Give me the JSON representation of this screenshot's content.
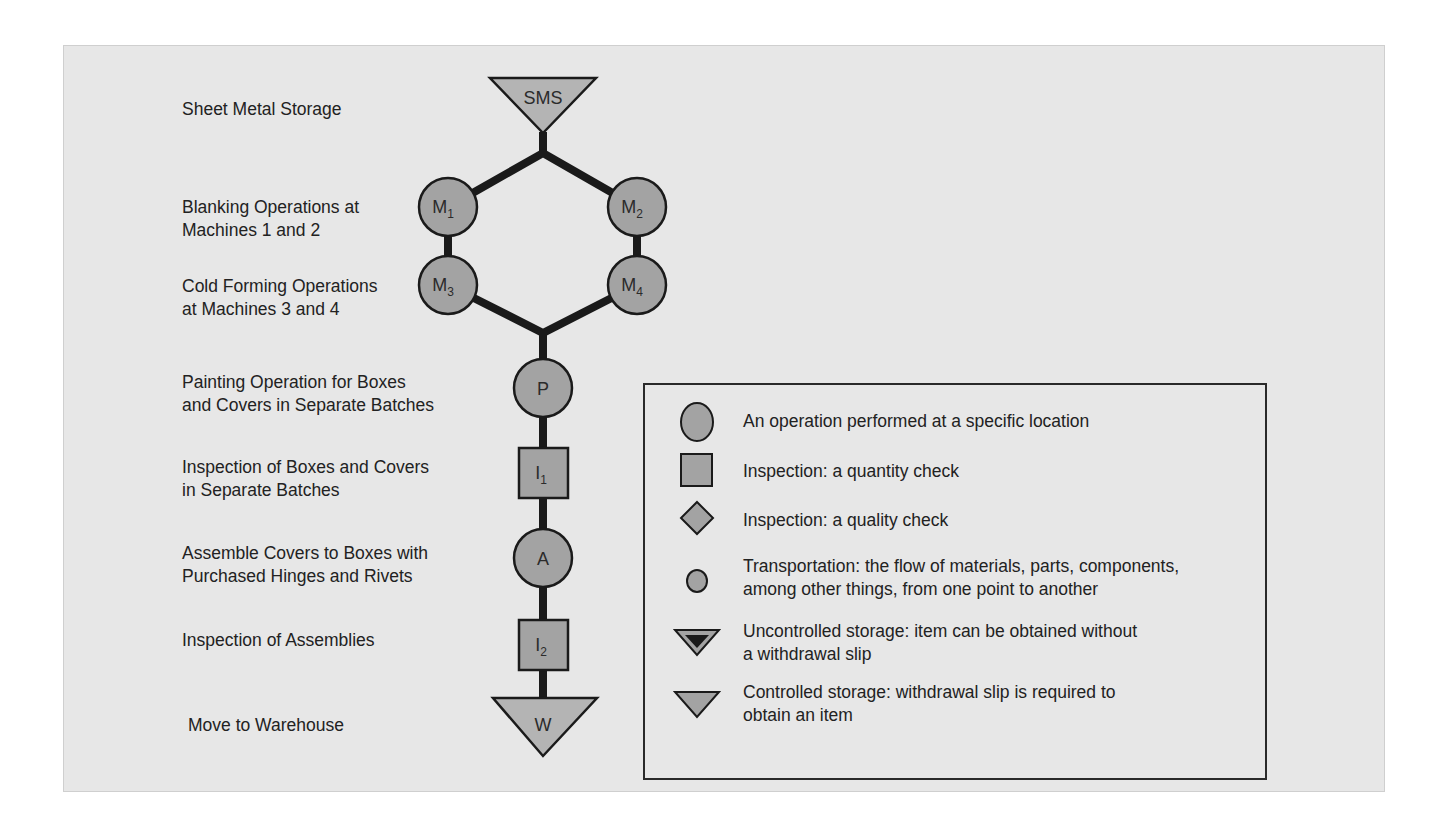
{
  "colors": {
    "background": "#ffffff",
    "panel": "#e7e7e7",
    "shape_fill": "#a3a3a3",
    "storage_fill": "#b4b4b4",
    "line": "#1a1a1a",
    "text": "#222222"
  },
  "steps": [
    {
      "lines": [
        "Sheet Metal Storage"
      ]
    },
    {
      "lines": [
        "Blanking Operations at",
        "Machines 1 and 2"
      ]
    },
    {
      "lines": [
        "Cold Forming Operations",
        "at Machines 3 and 4"
      ]
    },
    {
      "lines": [
        "Painting Operation for Boxes",
        "and Covers in Separate Batches"
      ]
    },
    {
      "lines": [
        "Inspection of Boxes and Covers",
        "in Separate Batches"
      ]
    },
    {
      "lines": [
        "Assemble Covers to Boxes with",
        "Purchased Hinges and Rivets"
      ]
    },
    {
      "lines": [
        "Inspection of Assemblies"
      ]
    },
    {
      "lines": [
        "Move to Warehouse"
      ]
    }
  ],
  "nodes": {
    "sms": {
      "label": "SMS",
      "type": "controlled-storage"
    },
    "m1": {
      "label": "M",
      "sub": "1",
      "type": "operation"
    },
    "m2": {
      "label": "M",
      "sub": "2",
      "type": "operation"
    },
    "m3": {
      "label": "M",
      "sub": "3",
      "type": "operation"
    },
    "m4": {
      "label": "M",
      "sub": "4",
      "type": "operation"
    },
    "p": {
      "label": "P",
      "type": "operation"
    },
    "i1": {
      "label": "I",
      "sub": "1",
      "type": "inspection-quantity"
    },
    "a": {
      "label": "A",
      "type": "operation"
    },
    "i2": {
      "label": "I",
      "sub": "2",
      "type": "inspection-quantity"
    },
    "w": {
      "label": "W",
      "type": "controlled-storage"
    }
  },
  "legend": {
    "items": [
      {
        "icon": "operation-circle-icon",
        "lines": [
          "An operation performed at a specific location"
        ]
      },
      {
        "icon": "inspection-quantity-square-icon",
        "lines": [
          "Inspection: a quantity check"
        ]
      },
      {
        "icon": "inspection-quality-diamond-icon",
        "lines": [
          "Inspection: a quality check"
        ]
      },
      {
        "icon": "transportation-small-circle-icon",
        "lines": [
          "Transportation: the flow of materials, parts, components,",
          "among other things, from one point to another"
        ]
      },
      {
        "icon": "uncontrolled-storage-triangle-icon",
        "lines": [
          "Uncontrolled storage: item can be obtained without",
          "a withdrawal slip"
        ]
      },
      {
        "icon": "controlled-storage-triangle-icon",
        "lines": [
          "Controlled storage: withdrawal slip is required to",
          "obtain an item"
        ]
      }
    ]
  }
}
